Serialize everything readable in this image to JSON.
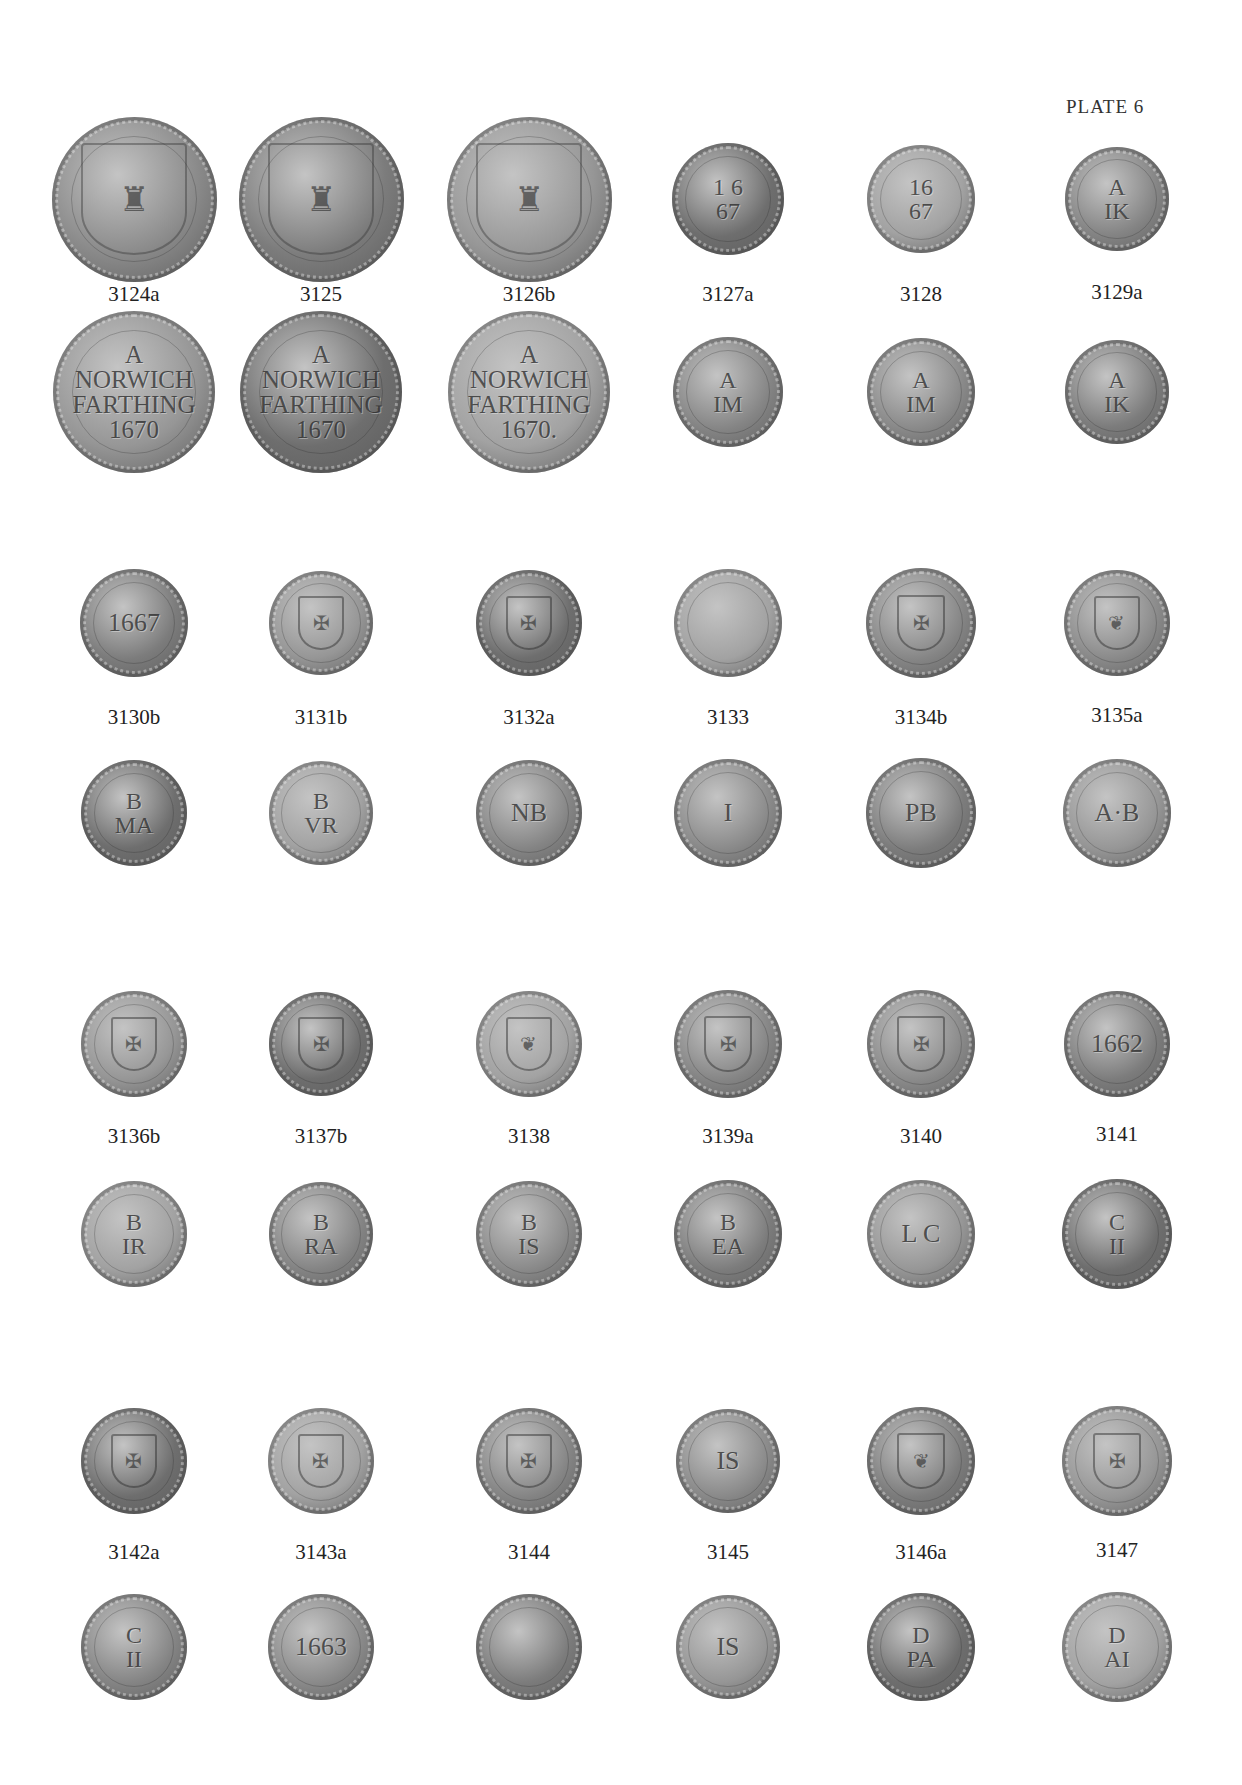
{
  "page": {
    "title": "PLATE 6"
  },
  "groups": [
    {
      "coins": [
        {
          "label": "3124a",
          "obverse": "shield with castle and lion",
          "reverse": "A\nNORWICH\nFARTHING\n1670"
        },
        {
          "label": "3125",
          "obverse": "shield with castle and lion",
          "reverse": "A\nNORWICH\nFARTHING\n1670"
        },
        {
          "label": "3126b",
          "obverse": "shield with castle and lion",
          "reverse": "A\nNORWICH\nFARTHING\n1670."
        },
        {
          "label": "3127a",
          "obverse": "1 6\n67",
          "obverse_legend": "JAMES AVBREY",
          "reverse": "A\nIM",
          "reverse_legend": "IN NORWICH"
        },
        {
          "label": "3128",
          "obverse": "16\n67",
          "obverse_legend": "JAMES AVBREY",
          "reverse": "A\nIM",
          "reverse_legend": "IN NORWICH"
        },
        {
          "label": "3129a",
          "obverse": "A\nIK",
          "obverse_legend": "JOHN ARNOLD",
          "reverse": "A\nIK",
          "reverse_legend": "IN NORWICH"
        }
      ]
    },
    {
      "coins": [
        {
          "label": "3130b",
          "obverse": "1667",
          "reverse": "B\nMA"
        },
        {
          "label": "3131b",
          "obverse": "figure",
          "obverse_legend": "VIOLET BENTON",
          "reverse": "B\nVR",
          "reverse_legend": "IN NORWICH 1664"
        },
        {
          "label": "3132a",
          "obverse": "arms shield",
          "reverse": "NB",
          "reverse_legend": "OF NORWICH"
        },
        {
          "label": "3133",
          "obverse": "",
          "obverse_legend": "JOHN BLAND",
          "reverse": "I",
          "reverse_legend": "IN NORWICH"
        },
        {
          "label": "3134b",
          "obverse": "arms shield",
          "obverse_legend": "PHILLIP BLOFIELD",
          "reverse": "PB",
          "reverse_legend": "IN NORWICH"
        },
        {
          "label": "3135a",
          "obverse": "cock",
          "obverse_legend": "AVGVSTINE BRIGGS",
          "reverse": "A·B",
          "reverse_legend": "IN NORWICH"
        }
      ]
    },
    {
      "coins": [
        {
          "label": "3136b",
          "obverse": "castle arms",
          "obverse_legend": "JAMES BROCKDEN",
          "reverse": "B\nIR",
          "reverse_legend": "IN NORWICH 1661"
        },
        {
          "label": "3137b",
          "obverse": "arms",
          "obverse_legend": "ROBERT",
          "reverse": "B\nRA",
          "reverse_legend": "IN NORWICH"
        },
        {
          "label": "3138",
          "obverse": "lamb",
          "obverse_legend": "JOHN BROWNE",
          "reverse": "B\nIS",
          "reverse_legend": "IN NORWICH 1657"
        },
        {
          "label": "3139a",
          "obverse": "arms shield",
          "obverse_legend": "EDWARD BVXTON",
          "reverse": "B\nEA",
          "reverse_legend": "OF NORWICH 1653"
        },
        {
          "label": "3140",
          "obverse": "arms shield",
          "obverse_legend": "EDMVND CMOND",
          "reverse": "L C",
          "reverse_legend": "OF NORWICH GROCER"
        },
        {
          "label": "3141",
          "obverse": "1662",
          "obverse_legend": "JAMES GARLAND",
          "reverse": "C\nII",
          "reverse_legend": "IN NORWICH"
        }
      ]
    },
    {
      "coins": [
        {
          "label": "3142a",
          "obverse": "castle gate",
          "obverse_legend": "JAMES CASTILL",
          "reverse": "C\nII",
          "reverse_legend": "IN NORWICH 1663"
        },
        {
          "label": "3143a",
          "obverse": "arms shield",
          "reverse": "1663",
          "reverse_legend": "IN NORWICH"
        },
        {
          "label": "3144",
          "obverse": "device",
          "obverse_legend": "PHILLIP",
          "reverse": "",
          "reverse_legend": "IN NORWICH"
        },
        {
          "label": "3145",
          "obverse": "IS",
          "reverse": "IS",
          "reverse_legend": "IN NORWICH"
        },
        {
          "label": "3146a",
          "obverse": "swan",
          "obverse_legend": "PETER DEALE",
          "reverse": "D\nPA",
          "reverse_legend": "IN NORWICH 1658"
        },
        {
          "label": "3147",
          "obverse": "device",
          "obverse_legend": "ABRAHAM",
          "reverse": "D\nAI",
          "reverse_legend": "IN NORWICH"
        }
      ]
    }
  ]
}
